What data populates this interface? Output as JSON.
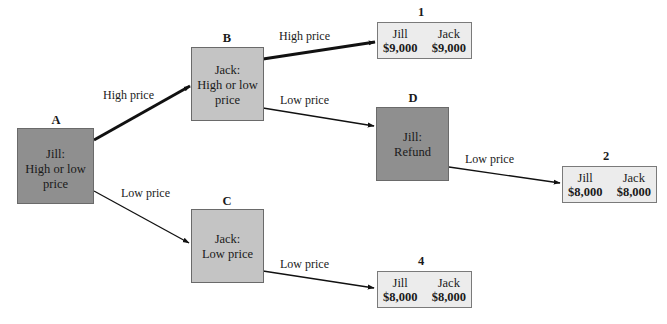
{
  "diagram": {
    "type": "game-tree",
    "colors": {
      "decision_dark": "#8f8f8f",
      "decision_light": "#c4c4c4",
      "payoff_bg": "#ececec",
      "edge": "#111111"
    },
    "nodes": {
      "A": {
        "letter": "A",
        "player": "Jill:",
        "line2": "High or low",
        "line3": "price"
      },
      "B": {
        "letter": "B",
        "player": "Jack:",
        "line2": "High or low",
        "line3": "price"
      },
      "C": {
        "letter": "C",
        "player": "Jack:",
        "line2": "Low price"
      },
      "D": {
        "letter": "D",
        "player": "Jill:",
        "line2": "Refund"
      }
    },
    "payoffs": {
      "p1": {
        "number": "1",
        "left_name": "Jill",
        "left_value": "$9,000",
        "right_name": "Jack",
        "right_value": "$9,000"
      },
      "p2": {
        "number": "2",
        "left_name": "Jill",
        "left_value": "$8,000",
        "right_name": "Jack",
        "right_value": "$8,000"
      },
      "p4": {
        "number": "4",
        "left_name": "Jill",
        "left_value": "$8,000",
        "right_name": "Jack",
        "right_value": "$8,000"
      }
    },
    "edges": [
      {
        "from": "A",
        "to": "B",
        "label": "High price",
        "emphasis": "thick"
      },
      {
        "from": "A",
        "to": "C",
        "label": "Low price",
        "emphasis": "normal"
      },
      {
        "from": "B",
        "to": "1",
        "label": "High price",
        "emphasis": "thick"
      },
      {
        "from": "B",
        "to": "D",
        "label": "Low price",
        "emphasis": "normal"
      },
      {
        "from": "D",
        "to": "2",
        "label": "Low price",
        "emphasis": "normal"
      },
      {
        "from": "C",
        "to": "4",
        "label": "Low price",
        "emphasis": "normal"
      }
    ]
  }
}
